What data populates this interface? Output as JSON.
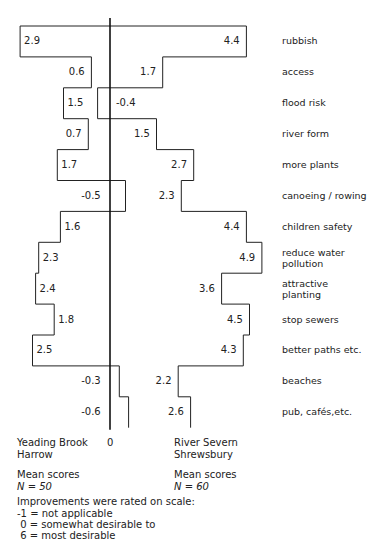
{
  "chart_data": {
    "type": "bar",
    "orientation": "horizontal-butterfly",
    "title": "",
    "categories": [
      "rubbish",
      "access",
      "flood risk",
      "river form",
      "more plants",
      "canoeing / rowing",
      "children safety",
      "reduce water pollution",
      "attractive planting",
      "stop sewers",
      "better paths etc.",
      "beaches",
      "pub, cafés,etc."
    ],
    "series": [
      {
        "name": "Yeading Brook Harrow",
        "values": [
          2.9,
          0.6,
          1.5,
          0.7,
          1.7,
          -0.5,
          1.6,
          2.3,
          2.4,
          1.8,
          2.5,
          -0.3,
          -0.6
        ],
        "direction": "left",
        "n": 50
      },
      {
        "name": "River Severn Shrewsbury",
        "values": [
          4.4,
          1.7,
          -0.4,
          1.5,
          2.7,
          2.3,
          4.4,
          4.9,
          3.6,
          4.5,
          4.3,
          2.2,
          2.6
        ],
        "direction": "right",
        "n": 60
      }
    ],
    "axis_zero_label": "0",
    "xlim": [
      -1,
      6
    ]
  },
  "labels": {
    "zero": "0",
    "left_site_line1": "Yeading Brook",
    "left_site_line2": "Harrow",
    "right_site_line1": "River Severn",
    "right_site_line2": "Shrewsbury",
    "left_mean": "Mean scores",
    "left_n": "N = 50",
    "right_mean": "Mean scores",
    "right_n": "N = 60",
    "scale_title": "Improvements were rated on scale:",
    "scale_1": "-1 = not applicable",
    "scale_2": " 0 = somewhat desirable to",
    "scale_3": " 6 = most desirable"
  },
  "rows": [
    {
      "cat": "rubbish",
      "l": "2.9",
      "r": "4.4"
    },
    {
      "cat": "access",
      "l": "0.6",
      "r": "1.7"
    },
    {
      "cat": "flood risk",
      "l": "1.5",
      "r": "-0.4"
    },
    {
      "cat": "river form",
      "l": "0.7",
      "r": "1.5"
    },
    {
      "cat": "more plants",
      "l": "1.7",
      "r": "2.7"
    },
    {
      "cat": "canoeing / rowing",
      "l": "-0.5",
      "r": "2.3"
    },
    {
      "cat": "children safety",
      "l": "1.6",
      "r": "4.4"
    },
    {
      "cat": "reduce water",
      "cat2": "pollution",
      "l": "2.3",
      "r": "4.9"
    },
    {
      "cat": "attractive",
      "cat2": "planting",
      "l": "2.4",
      "r": "3.6"
    },
    {
      "cat": "stop sewers",
      "l": "1.8",
      "r": "4.5"
    },
    {
      "cat": "better paths etc.",
      "l": "2.5",
      "r": "4.3"
    },
    {
      "cat": "beaches",
      "l": "-0.3",
      "r": "2.2"
    },
    {
      "cat": "pub, cafés,etc.",
      "l": "-0.6",
      "r": "2.6"
    }
  ]
}
